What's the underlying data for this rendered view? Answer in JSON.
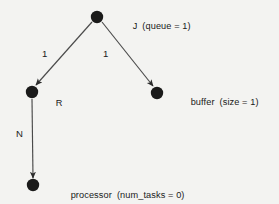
{
  "diagram": {
    "type": "directed-graph",
    "background_color": "#f3f3f1",
    "node_color": "#1a1a1a",
    "edge_color": "#4a4a4a",
    "text_color": "#1a1a1a",
    "nodes": [
      {
        "id": "J",
        "name": "J",
        "attribute": "(queue = 1)",
        "cx": 97,
        "cy": 17,
        "r": 6.2,
        "label_x": 122,
        "label_y": 13
      },
      {
        "id": "R",
        "name": "R",
        "attribute": "",
        "cx": 32,
        "cy": 92,
        "r": 6.2,
        "label_x": 45,
        "label_y": 90
      },
      {
        "id": "buffer",
        "name": "buffer",
        "attribute": "(size = 1)",
        "cx": 157,
        "cy": 93,
        "r": 6.2,
        "label_x": 180,
        "label_y": 89
      },
      {
        "id": "processor",
        "name": "processor",
        "attribute": "(num_tasks = 0)",
        "cx": 33,
        "cy": 185,
        "r": 6.2,
        "label_x": 60,
        "label_y": 182
      }
    ],
    "edges": [
      {
        "id": "J-R",
        "from": "J",
        "to": "R",
        "label": "1",
        "label_x": 42,
        "label_y": 49,
        "x1": 92,
        "y1": 22,
        "x2": 36,
        "y2": 85
      },
      {
        "id": "J-buffer",
        "from": "J",
        "to": "buffer",
        "label": "1",
        "label_x": 103,
        "label_y": 49,
        "x1": 102,
        "y1": 22,
        "x2": 153,
        "y2": 86
      },
      {
        "id": "R-processor",
        "from": "R",
        "to": "processor",
        "label": "N",
        "label_x": 16,
        "label_y": 129,
        "x1": 32,
        "y1": 99,
        "x2": 33,
        "y2": 178
      }
    ]
  }
}
